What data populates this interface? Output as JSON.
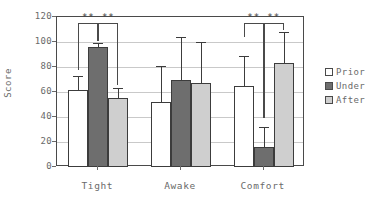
{
  "chart_data": {
    "type": "bar",
    "title": "",
    "subtitle": "",
    "xlabel": "",
    "ylabel": "Score",
    "categories": [
      "Tight",
      "Awake",
      "Comfort"
    ],
    "ylim": [
      0,
      120
    ],
    "yticks": [
      0,
      20,
      40,
      60,
      80,
      100,
      120
    ],
    "ytick_labels": [
      "0",
      "20",
      "40",
      "60",
      "80",
      "100",
      "120"
    ],
    "grid": true,
    "legend_position": "right",
    "series": [
      {
        "name": "Prior",
        "key": "prior",
        "color": "#ffffff",
        "values": [
          62,
          52,
          65
        ],
        "errors_upper": [
          73,
          81,
          89
        ]
      },
      {
        "name": "Under",
        "key": "under",
        "color": "#6e6e6e",
        "values": [
          96,
          70,
          16
        ],
        "errors_upper": [
          99,
          104,
          32
        ]
      },
      {
        "name": "After",
        "key": "after",
        "color": "#cfcfcf",
        "values": [
          55,
          67,
          83
        ],
        "errors_upper": [
          63,
          100,
          108
        ]
      }
    ],
    "annotations": [
      {
        "group": "Tight",
        "from": "Prior",
        "to": "Under",
        "text": "**",
        "bracket_top": 115,
        "bracket_left_bottom": 78,
        "bracket_right_bottom": 101
      },
      {
        "group": "Tight",
        "from": "Under",
        "to": "After",
        "text": "**",
        "bracket_top": 115,
        "bracket_left_bottom": 101,
        "bracket_right_bottom": 66
      },
      {
        "group": "Comfort",
        "from": "Prior",
        "to": "Under",
        "text": "**",
        "bracket_top": 115,
        "bracket_left_bottom": 104,
        "bracket_right_bottom": 39
      },
      {
        "group": "Comfort",
        "from": "Under",
        "to": "After",
        "text": "**",
        "bracket_top": 115,
        "bracket_left_bottom": 39,
        "bracket_right_bottom": 110
      }
    ]
  },
  "legend": {
    "items": [
      {
        "label": "Prior",
        "key": "prior"
      },
      {
        "label": "Under",
        "key": "under"
      },
      {
        "label": "After",
        "key": "after"
      }
    ]
  },
  "axis": {
    "y_title": "Score"
  }
}
